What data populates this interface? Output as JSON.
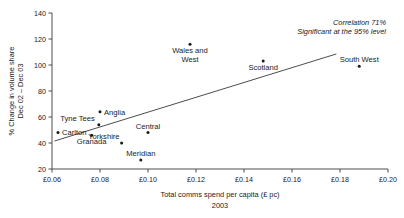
{
  "chart_data": {
    "type": "scatter",
    "title": "",
    "xlabel": "Total comms spend per capita (£ pc)",
    "xlabel_line2": "2003",
    "ylabel_line1": "% Change in volume share",
    "ylabel_line2": "Dec 02 – Dec 03",
    "xlim": [
      0.06,
      0.2
    ],
    "ylim": [
      20,
      140
    ],
    "xticks": [
      0.06,
      0.08,
      0.1,
      0.12,
      0.14,
      0.16,
      0.18,
      0.2
    ],
    "xticklabels": [
      "£0.06",
      "£0.08",
      "£0.10",
      "£0.12",
      "£0.14",
      "£0.16",
      "£0.18",
      "£0.20"
    ],
    "yticks": [
      20,
      40,
      60,
      80,
      100,
      120,
      140
    ],
    "yticklabels": [
      "20",
      "40",
      "60",
      "80",
      "100",
      "120",
      "140"
    ],
    "grid": false,
    "legend": "none",
    "points": [
      {
        "label": "Carlton",
        "x": 0.0625,
        "y": 48,
        "label_pos": "right",
        "lines": [
          "Carlton"
        ]
      },
      {
        "label": "Tyne Tees",
        "x": 0.0795,
        "y": 54,
        "label_pos": "left",
        "lines": [
          "Tyne Tees"
        ]
      },
      {
        "label": "Granada",
        "x": 0.0765,
        "y": 46,
        "label_pos": "below",
        "lines": [
          "Granada"
        ]
      },
      {
        "label": "Anglia",
        "x": 0.08,
        "y": 64,
        "label_pos": "right",
        "lines": [
          "Anglia"
        ]
      },
      {
        "label": "Yorkshire",
        "x": 0.089,
        "y": 40,
        "label_pos": "above-left",
        "lines": [
          "Yorkshire"
        ]
      },
      {
        "label": "Central",
        "x": 0.1,
        "y": 48,
        "label_pos": "above",
        "lines": [
          "Central"
        ]
      },
      {
        "label": "Meridian",
        "x": 0.097,
        "y": 27,
        "label_pos": "above",
        "lines": [
          "Meridian"
        ]
      },
      {
        "label": "Wales and West",
        "x": 0.1175,
        "y": 116,
        "label_pos": "below",
        "lines": [
          "Wales and",
          "West"
        ]
      },
      {
        "label": "Scotland",
        "x": 0.148,
        "y": 103,
        "label_pos": "below",
        "lines": [
          "Scotland"
        ]
      },
      {
        "label": "South West",
        "x": 0.188,
        "y": 99,
        "label_pos": "above",
        "lines": [
          "South West"
        ]
      }
    ],
    "trendline": {
      "x1": 0.061,
      "y1": 41.5,
      "x2": 0.1785,
      "y2": 108.5
    },
    "annotations": [
      {
        "text": "Correlation 71%",
        "style": "italic"
      },
      {
        "text": "Significant at the 95% level",
        "style": "italic"
      }
    ]
  }
}
